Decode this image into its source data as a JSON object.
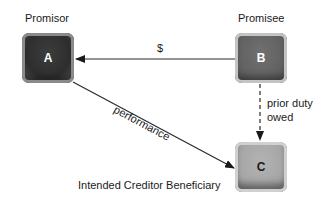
{
  "diagram": {
    "nodes": {
      "a": {
        "letter": "A",
        "role": "Promisor",
        "color": "#333333"
      },
      "b": {
        "letter": "B",
        "role": "Promisee",
        "color": "#666666"
      },
      "c": {
        "letter": "C",
        "role": "Intended Creditor Beneficiary",
        "color": "#a8a8a8"
      }
    },
    "edges": {
      "b_to_a": {
        "label": "$",
        "style": "solid"
      },
      "b_to_c": {
        "label_line1": "prior duty",
        "label_line2": "owed",
        "style": "dashed"
      },
      "a_to_c": {
        "label": "performance",
        "style": "solid"
      }
    }
  }
}
